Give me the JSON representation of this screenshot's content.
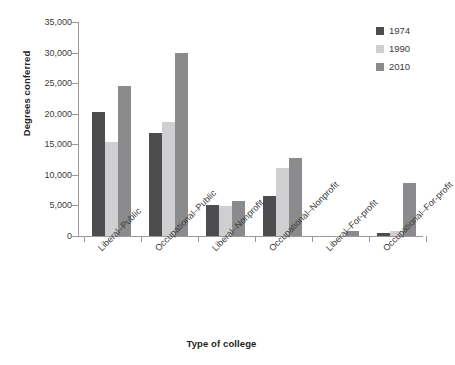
{
  "chart_data": {
    "type": "bar",
    "title": "",
    "xlabel": "Type of college",
    "ylabel": "Degrees conferred",
    "ylim": [
      0,
      35000
    ],
    "ytick_values": [
      0,
      5000,
      10000,
      15000,
      20000,
      25000,
      30000,
      35000
    ],
    "ytick_labels": [
      "0",
      "5,000",
      "10,000",
      "15,000",
      "20,000",
      "25,000",
      "30,000",
      "35,000"
    ],
    "grid": false,
    "legend_position": "top-right",
    "categories": [
      "Liberal–Public",
      "Occupational–Public",
      "Liberal–Nonprofit",
      "Occupational–Nonprofit",
      "Liberal–For-profit",
      "Occupational–For-profit"
    ],
    "series": [
      {
        "name": "1974",
        "color": "#4d4d4f",
        "values": [
          20300,
          16900,
          5000,
          6600,
          0,
          500
        ]
      },
      {
        "name": "1990",
        "color": "#cfcfd1",
        "values": [
          15300,
          18600,
          4850,
          11200,
          0,
          900
        ]
      },
      {
        "name": "2010",
        "color": "#8b8b8d",
        "values": [
          24500,
          29900,
          5800,
          12700,
          750,
          8700
        ]
      }
    ]
  },
  "legend": {
    "entries": [
      {
        "label": "1974",
        "color": "#4d4d4f"
      },
      {
        "label": "1990",
        "color": "#cfcfd1"
      },
      {
        "label": "2010",
        "color": "#8b8b8d"
      }
    ]
  },
  "axes": {
    "y_title": "Degrees conferred",
    "x_title": "Type of college"
  }
}
